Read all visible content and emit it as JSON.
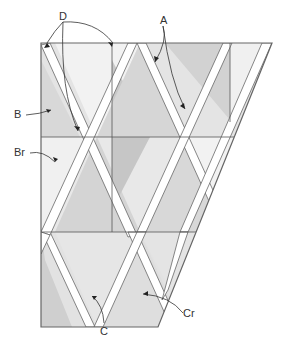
{
  "diagram": {
    "type": "quilt-piecing-diagram",
    "labels": {
      "A": "A",
      "B": "B",
      "Br": "Br",
      "C": "C",
      "Cr": "Cr",
      "D": "D"
    },
    "colors": {
      "outline": "#555555",
      "strip": "#ffffff",
      "shade_light": "#ececec",
      "shade_mid": "#dcdcdc",
      "shade_dark": "#cbcbcb",
      "shade_lightest": "#f3f3f3"
    }
  }
}
